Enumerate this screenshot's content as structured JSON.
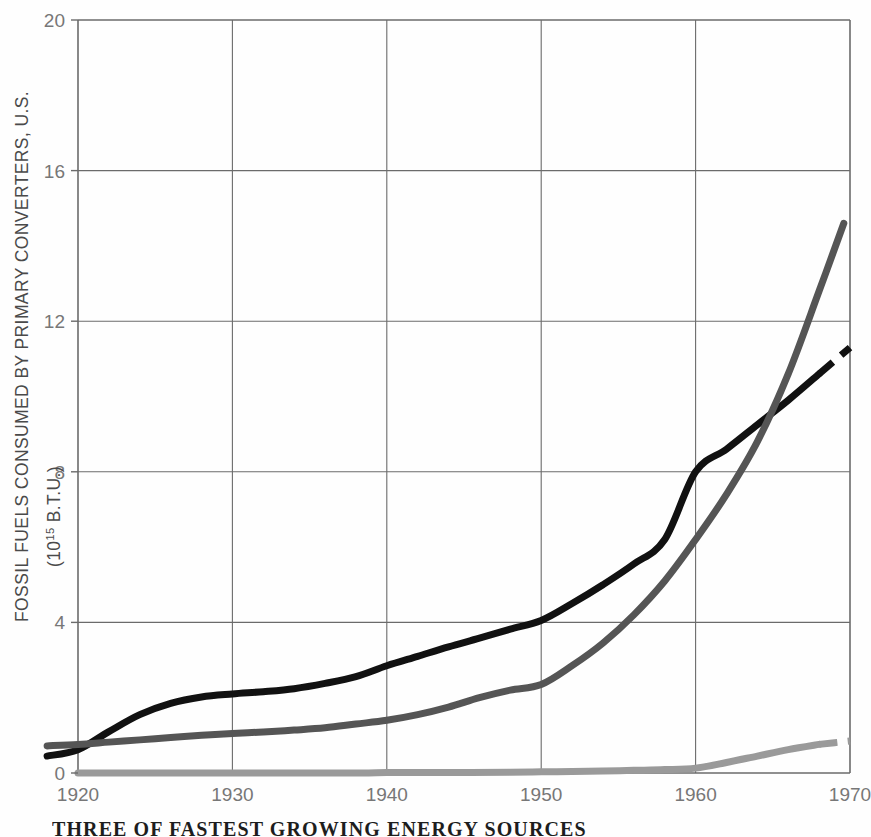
{
  "figure": {
    "caption": "THREE OF FASTEST GROWING ENERGY SOURCES",
    "background_color": "#fefefe"
  },
  "chart_data": {
    "type": "line",
    "title": "",
    "subtitle": "",
    "xlabel": "",
    "ylabel": "FOSSIL FUELS CONSUMED BY PRIMARY CONVERTERS, U.S.",
    "ylabel_units_prefix": "(10",
    "ylabel_units_exponent": "15",
    "ylabel_units_suffix": " B.T.U.)",
    "xlim": [
      1918,
      1970
    ],
    "ylim": [
      0,
      20
    ],
    "xticks": [
      1920,
      1930,
      1940,
      1950,
      1960,
      1970
    ],
    "xtick_labels": [
      "1920",
      "1930",
      "1940",
      "1950",
      "1960",
      "1970"
    ],
    "yticks": [
      0,
      4,
      8,
      12,
      16,
      20
    ],
    "ytick_labels": [
      "0",
      "4",
      "8",
      "12",
      "16",
      "20"
    ],
    "grid": true,
    "grid_color": "#6b6b6b",
    "legend": "none",
    "series": [
      {
        "name": "coal",
        "color": "#111111",
        "width": 7,
        "dashed_from": 1966.5,
        "x": [
          1918,
          1920,
          1922,
          1924,
          1926,
          1928,
          1930,
          1932,
          1934,
          1936,
          1938,
          1940,
          1942,
          1944,
          1946,
          1948,
          1950,
          1952,
          1954,
          1956,
          1958,
          1960,
          1962,
          1964,
          1966,
          1968,
          1970
        ],
        "values": [
          0.45,
          0.62,
          1.1,
          1.55,
          1.85,
          2.02,
          2.1,
          2.16,
          2.24,
          2.38,
          2.56,
          2.85,
          3.1,
          3.35,
          3.58,
          3.82,
          4.05,
          4.5,
          5.0,
          5.55,
          6.2,
          8.0,
          8.6,
          9.25,
          9.9,
          10.6,
          11.3
        ]
      },
      {
        "name": "petroleum",
        "color": "#555555",
        "width": 7,
        "dashed_from": null,
        "x": [
          1918,
          1920,
          1922,
          1924,
          1926,
          1928,
          1930,
          1932,
          1934,
          1936,
          1938,
          1940,
          1942,
          1944,
          1946,
          1948,
          1950,
          1952,
          1954,
          1956,
          1958,
          1960,
          1962,
          1964,
          1966,
          1968,
          1969.6
        ],
        "values": [
          0.72,
          0.76,
          0.82,
          0.88,
          0.94,
          1.0,
          1.05,
          1.09,
          1.14,
          1.2,
          1.3,
          1.4,
          1.55,
          1.75,
          2.0,
          2.2,
          2.35,
          2.85,
          3.45,
          4.2,
          5.1,
          6.2,
          7.4,
          8.8,
          10.6,
          12.8,
          14.6
        ]
      },
      {
        "name": "natural-gas",
        "color": "#9a9a9a",
        "width": 7,
        "dashed_from": 1967.5,
        "x": [
          1920,
          1930,
          1938,
          1940,
          1944,
          1948,
          1950,
          1952,
          1954,
          1956,
          1958,
          1960,
          1962,
          1964,
          1966,
          1968,
          1970
        ],
        "values": [
          0.0,
          0.0,
          0.0,
          0.01,
          0.015,
          0.02,
          0.03,
          0.04,
          0.05,
          0.07,
          0.09,
          0.13,
          0.28,
          0.45,
          0.62,
          0.76,
          0.85
        ]
      }
    ]
  }
}
